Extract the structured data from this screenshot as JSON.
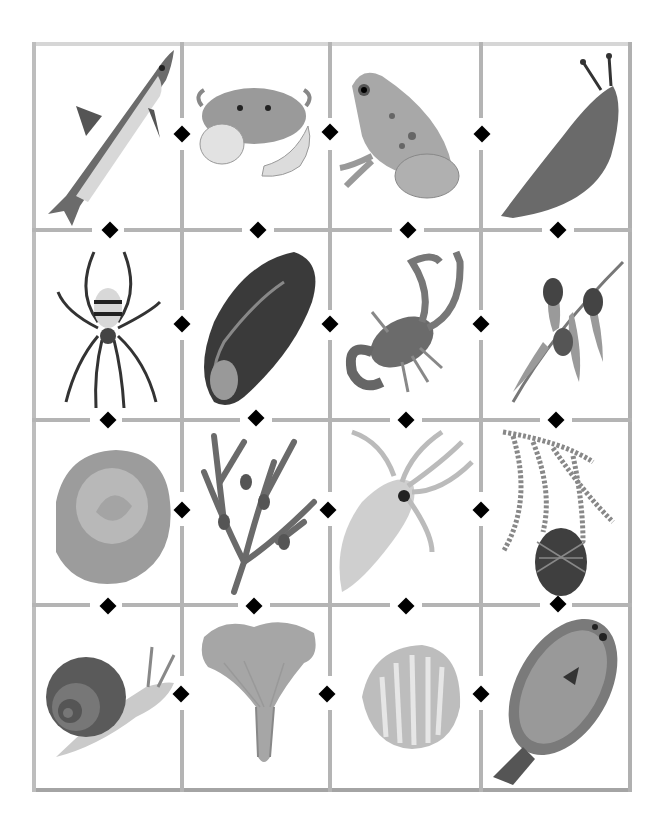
{
  "worksheet": {
    "grid": {
      "rows": 4,
      "cols": 4,
      "line_color": "#b4b4b4",
      "marker_color": "#000000"
    },
    "cells": [
      [
        "fish",
        "crab",
        "frog",
        "slug"
      ],
      [
        "spider",
        "mussel",
        "scorpion",
        "olive-branch"
      ],
      [
        "cabbage",
        "seaweed",
        "squid",
        "pine-cone-branch"
      ],
      [
        "snail",
        "mushroom",
        "clam-shell",
        "flatfish"
      ]
    ]
  }
}
